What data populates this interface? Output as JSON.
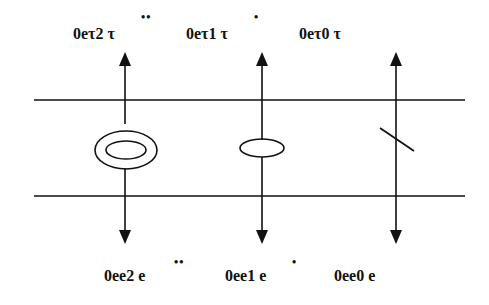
{
  "diagram": {
    "top_labels": [
      {
        "text": "0eτ2 τ",
        "dots": "••",
        "x": 117
      },
      {
        "text": "0eτ1 τ",
        "dots": "•",
        "x": 262
      },
      {
        "text": "0eτ0 τ",
        "dots": "",
        "x": 396
      }
    ],
    "bottom_labels": [
      {
        "text": "0ee2 e",
        "dots": "••",
        "x": 125
      },
      {
        "text": "0ee1 e",
        "dots": "•",
        "x": 262
      },
      {
        "text": "0ee0  e",
        "dots": "",
        "x": 396
      }
    ],
    "elements": [
      {
        "type": "mass-double-ellipse",
        "x": 125
      },
      {
        "type": "damper-ellipse",
        "x": 262
      },
      {
        "type": "spring-slash",
        "x": 396
      }
    ],
    "colors": {
      "line": "#111111",
      "background": "#ffffff"
    }
  }
}
